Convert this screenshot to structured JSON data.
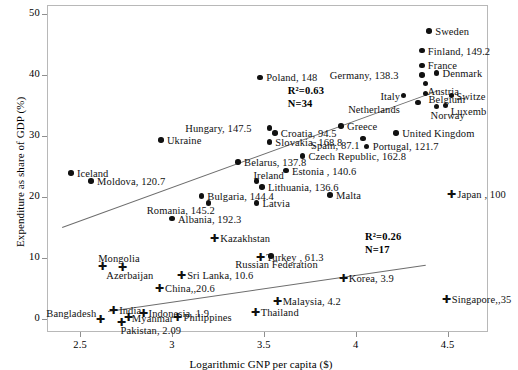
{
  "chart_data": {
    "type": "scatter",
    "title": "",
    "xlabel": "Logarithmic GNP per capita ($)",
    "ylabel": "Expenditure as share of GDP (%)",
    "xlim": [
      2.32,
      4.72
    ],
    "ylim": [
      -2.2,
      51.5
    ],
    "xticks": [
      "2.5",
      "3",
      "3.5",
      "4",
      "4.5"
    ],
    "xtick_values": [
      2.5,
      3,
      3.5,
      4,
      4.5
    ],
    "yticks": [
      "0",
      "10",
      "20",
      "30",
      "40",
      "50"
    ],
    "ytick_values": [
      0,
      10,
      20,
      30,
      40,
      50
    ],
    "grid": false,
    "legend": "none",
    "marker_types": {
      "circle": "filled-circle",
      "cross": "plus-cross"
    },
    "annotations": [
      {
        "name": "upper-group-stats",
        "r2_label": "R²=0.63",
        "n_label": "N=34",
        "x": 3.63,
        "y": 38.6
      },
      {
        "name": "lower-group-stats",
        "r2_label": "R²=0.26",
        "n_label": "N=17",
        "x": 4.05,
        "y": 14.6
      }
    ],
    "trendlines": [
      {
        "name": "upper-trendline",
        "x0": 2.4,
        "y0": 15.1,
        "x1": 4.45,
        "y1": 37.6
      },
      {
        "name": "lower-trendline",
        "x0": 2.65,
        "y0": 1.2,
        "x1": 4.38,
        "y1": 8.8
      }
    ],
    "series": [
      {
        "name": "Upper group (developed / transition)",
        "marker": "circle",
        "points": [
          {
            "label": "Sweden",
            "x": 4.4,
            "y": 47.2,
            "lx": 6,
            "ly": -5
          },
          {
            "label": "Finland, 149.2",
            "x": 4.36,
            "y": 44.0,
            "lx": 6,
            "ly": -5
          },
          {
            "label": "France",
            "x": 4.36,
            "y": 41.6,
            "lx": 6,
            "ly": -5
          },
          {
            "label": "Denmark",
            "x": 4.44,
            "y": 40.3,
            "lx": 6,
            "ly": -5
          },
          {
            "label": "Germany, 138.3",
            "x": 4.36,
            "y": 40.0,
            "lx": -92,
            "ly": -5
          },
          {
            "label": "Austria",
            "x": 4.38,
            "y": 38.6,
            "lx": 2,
            "ly": 2
          },
          {
            "label": "Belgium",
            "x": 4.38,
            "y": 37.0,
            "lx": 3,
            "ly": 1
          },
          {
            "label": "Switze",
            "x": 4.52,
            "y": 36.6,
            "lx": 5,
            "ly": -5
          },
          {
            "label": "Italy",
            "x": 4.26,
            "y": 36.6,
            "lx": -23,
            "ly": -5
          },
          {
            "label": "Netherlands",
            "x": 4.34,
            "y": 35.5,
            "lx": -70,
            "ly": 2
          },
          {
            "label": "Luxemb",
            "x": 4.49,
            "y": 35.0,
            "lx": 5,
            "ly": 1
          },
          {
            "label": "Norway",
            "x": 4.44,
            "y": 34.8,
            "lx": -6,
            "ly": 3
          },
          {
            "label": "Poland, 148",
            "x": 3.48,
            "y": 39.6,
            "lx": 6,
            "ly": -5
          },
          {
            "label": "Greece",
            "x": 3.92,
            "y": 31.6,
            "lx": 6,
            "ly": -5
          },
          {
            "label": "United Kingdom",
            "x": 4.22,
            "y": 30.5,
            "lx": 6,
            "ly": -5
          },
          {
            "label": "Spain, 87.1",
            "x": 4.04,
            "y": 29.6,
            "lx": -52,
            "ly": 2
          },
          {
            "label": "Hungary, 147.5",
            "x": 3.53,
            "y": 31.3,
            "lx": -84,
            "ly": -5
          },
          {
            "label": "Croatia, 94.5",
            "x": 3.56,
            "y": 30.5,
            "lx": 6,
            "ly": -5
          },
          {
            "label": "Slovakia, 168.8",
            "x": 3.53,
            "y": 29.0,
            "lx": 6,
            "ly": -5
          },
          {
            "label": "Portugal, 121.7",
            "x": 4.06,
            "y": 28.3,
            "lx": 6,
            "ly": -5
          },
          {
            "label": "Czech Republic, 162.8",
            "x": 3.71,
            "y": 26.7,
            "lx": 6,
            "ly": -5
          },
          {
            "label": "Belarus, 137.8",
            "x": 3.36,
            "y": 25.7,
            "lx": 6,
            "ly": -5
          },
          {
            "label": "Estonia , 140.6",
            "x": 3.62,
            "y": 24.3,
            "lx": 6,
            "ly": -5
          },
          {
            "label": "Iceland",
            "x": 2.45,
            "y": 23.9,
            "lx": 6,
            "ly": -5
          },
          {
            "label": "Moldova, 120.7",
            "x": 2.56,
            "y": 22.6,
            "lx": 6,
            "ly": -5
          },
          {
            "label": "Ireland",
            "x": 3.46,
            "y": 22.6,
            "lx": -3,
            "ly": -11
          },
          {
            "label": "Lithuania, 136.6",
            "x": 3.49,
            "y": 21.6,
            "lx": 6,
            "ly": -5
          },
          {
            "label": "Latvia",
            "x": 3.46,
            "y": 19.0,
            "lx": 6,
            "ly": -5
          },
          {
            "label": "Bulgaria, 144.4",
            "x": 3.16,
            "y": 20.1,
            "lx": 6,
            "ly": -5
          },
          {
            "label": "Romania, 145.2",
            "x": 3.2,
            "y": 19.0,
            "lx": -62,
            "ly": 2
          },
          {
            "label": "Albania, 192.3",
            "x": 3.0,
            "y": 16.4,
            "lx": 6,
            "ly": -5
          },
          {
            "label": "Malta",
            "x": 3.86,
            "y": 20.3,
            "lx": 6,
            "ly": -5
          },
          {
            "label": "Ukraine",
            "x": 2.94,
            "y": 29.3,
            "lx": 6,
            "ly": -5
          },
          {
            "label": "Russian Federation",
            "x": 3.54,
            "y": 10.3,
            "lx": -36,
            "ly": 3
          }
        ]
      },
      {
        "name": "Lower group (Asian)",
        "marker": "cross",
        "points": [
          {
            "label": "Japan , 100",
            "x": 4.52,
            "y": 20.4,
            "lx": 6,
            "ly": -5
          },
          {
            "label": "Kazakhstan",
            "x": 3.23,
            "y": 13.2,
            "lx": 6,
            "ly": -5
          },
          {
            "label": "Turkey , 61.3",
            "x": 3.48,
            "y": 10.1,
            "lx": 6,
            "ly": -5
          },
          {
            "label": "Korea, 3.9",
            "x": 3.93,
            "y": 6.6,
            "lx": 6,
            "ly": -5
          },
          {
            "label": "Singapore,,35",
            "x": 4.49,
            "y": 3.2,
            "lx": 6,
            "ly": -5
          },
          {
            "label": "Mongolia",
            "x": 2.62,
            "y": 8.7,
            "lx": -4,
            "ly": -13
          },
          {
            "label": "Azerbaijan",
            "x": 2.73,
            "y": 8.5,
            "lx": -16,
            "ly": 3
          },
          {
            "label": "Sri Lanka, 10.6",
            "x": 3.05,
            "y": 7.2,
            "lx": 6,
            "ly": -5
          },
          {
            "label": "China,,20.6",
            "x": 2.93,
            "y": 5.1,
            "lx": 6,
            "ly": -5
          },
          {
            "label": "Malaysia, 4.2",
            "x": 3.57,
            "y": 2.9,
            "lx": 6,
            "ly": -5
          },
          {
            "label": "India",
            "x": 2.68,
            "y": 1.4,
            "lx": 6,
            "ly": -5
          },
          {
            "label": "Indonesia, 1.9",
            "x": 2.84,
            "y": 1.0,
            "lx": 6,
            "ly": -5
          },
          {
            "label": "Thailand",
            "x": 3.45,
            "y": 1.1,
            "lx": 6,
            "ly": -5
          },
          {
            "label": "Myanmar",
            "x": 2.76,
            "y": 0.3,
            "lx": 4,
            "ly": -4
          },
          {
            "label": "Philippines",
            "x": 3.03,
            "y": 0.2,
            "lx": 6,
            "ly": -5
          },
          {
            "label": "Bangladesh",
            "x": 2.61,
            "y": 0.0,
            "lx": -54,
            "ly": -11
          },
          {
            "label": "Pakistan, 2.09",
            "x": 2.72,
            "y": -0.6,
            "lx": 0,
            "ly": 3
          }
        ]
      }
    ]
  }
}
